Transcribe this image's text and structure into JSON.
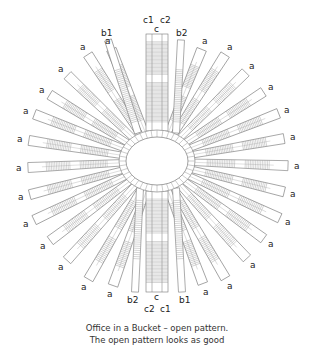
{
  "title": "Office in a Bucket – open pattern.",
  "caption": {
    "line1": "Office in a Bucket – open pattern.",
    "line2": "The open pattern looks as good"
  },
  "colors": {
    "stroke": "#777777",
    "hatch": "#999999",
    "label": "#222222",
    "background": "#ffffff"
  },
  "center": {
    "x": 157,
    "y": 161,
    "inner_rx": 31,
    "inner_ry": 24,
    "outer_rx": 38,
    "outer_ry": 31
  },
  "labels": {
    "top": [
      {
        "text": "b1",
        "x": 101,
        "y": 36
      },
      {
        "text": "c1",
        "x": 143,
        "y": 23
      },
      {
        "text": "c",
        "x": 154,
        "y": 32
      },
      {
        "text": "c2",
        "x": 160,
        "y": 23
      },
      {
        "text": "b2",
        "x": 176,
        "y": 36
      }
    ],
    "bottom": [
      {
        "text": "b2",
        "x": 127,
        "y": 303
      },
      {
        "text": "c",
        "x": 154,
        "y": 300
      },
      {
        "text": "c2",
        "x": 144,
        "y": 312
      },
      {
        "text": "c1",
        "x": 160,
        "y": 312
      },
      {
        "text": "b1",
        "x": 179,
        "y": 303
      }
    ],
    "a_left": [
      {
        "text": "a",
        "x": 105,
        "y": 44
      },
      {
        "text": "a",
        "x": 80,
        "y": 50
      },
      {
        "text": "a",
        "x": 58,
        "y": 72
      },
      {
        "text": "a",
        "x": 39,
        "y": 93
      },
      {
        "text": "a",
        "x": 23,
        "y": 114
      },
      {
        "text": "a",
        "x": 17,
        "y": 142
      },
      {
        "text": "a",
        "x": 16,
        "y": 171
      },
      {
        "text": "a",
        "x": 18,
        "y": 200
      },
      {
        "text": "a",
        "x": 23,
        "y": 227
      },
      {
        "text": "a",
        "x": 40,
        "y": 249
      },
      {
        "text": "a",
        "x": 58,
        "y": 270
      },
      {
        "text": "a",
        "x": 81,
        "y": 290
      },
      {
        "text": "a",
        "x": 107,
        "y": 297
      }
    ],
    "a_right": [
      {
        "text": "a",
        "x": 202,
        "y": 44
      },
      {
        "text": "a",
        "x": 227,
        "y": 50
      },
      {
        "text": "a",
        "x": 249,
        "y": 69
      },
      {
        "text": "a",
        "x": 268,
        "y": 90
      },
      {
        "text": "a",
        "x": 284,
        "y": 113
      },
      {
        "text": "a",
        "x": 290,
        "y": 140
      },
      {
        "text": "a",
        "x": 294,
        "y": 169
      },
      {
        "text": "a",
        "x": 290,
        "y": 197
      },
      {
        "text": "a",
        "x": 285,
        "y": 225
      },
      {
        "text": "a",
        "x": 268,
        "y": 247
      },
      {
        "text": "a",
        "x": 250,
        "y": 268
      },
      {
        "text": "a",
        "x": 227,
        "y": 289
      },
      {
        "text": "a",
        "x": 203,
        "y": 295
      }
    ]
  }
}
